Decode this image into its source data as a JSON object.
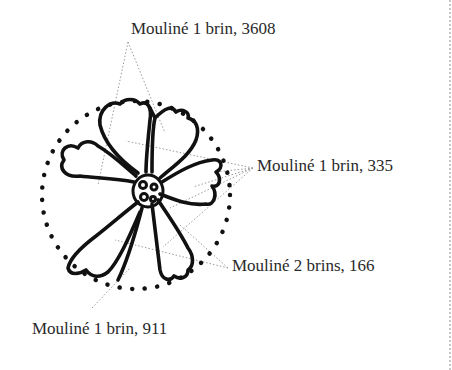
{
  "diagram": {
    "labels": [
      {
        "text": "Mouliné 1 brin, 3608",
        "x": 131,
        "y": 20
      },
      {
        "text": "Mouliné 1 brin, 335",
        "x": 257,
        "y": 157
      },
      {
        "text": "Mouliné 2 brins, 166",
        "x": 232,
        "y": 257
      },
      {
        "text": "Mouliné 1 brin, 911",
        "x": 32,
        "y": 320
      }
    ],
    "colors": {
      "outline": "#111111",
      "leader_lines": "#9a9a9a",
      "label_text": "#2a2a2a",
      "border": "#c8c8c8"
    }
  }
}
